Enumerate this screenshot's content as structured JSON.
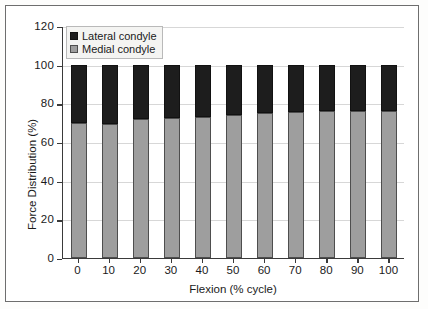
{
  "chart_data": {
    "type": "bar",
    "stacked": true,
    "title": "",
    "xlabel": "Flexion (% cycle)",
    "ylabel": "Force Distribution (%)",
    "categories": [
      "0",
      "10",
      "20",
      "30",
      "40",
      "50",
      "60",
      "70",
      "80",
      "90",
      "100"
    ],
    "series": [
      {
        "name": "Medial condyle",
        "color": "#9e9e9e",
        "values": [
          70,
          69.5,
          72,
          72.5,
          73,
          74,
          75,
          75.5,
          76,
          76,
          76
        ]
      },
      {
        "name": "Lateral condyle",
        "color": "#1d1d1d",
        "values": [
          30,
          30.5,
          28,
          27.5,
          27,
          26,
          25,
          24.5,
          24,
          24,
          24
        ]
      }
    ],
    "stack_totals": [
      100,
      100,
      100,
      100,
      100,
      100,
      100,
      100,
      100,
      100,
      100
    ],
    "ylim": [
      0,
      120
    ],
    "yticks": [
      "0",
      "20",
      "40",
      "60",
      "80",
      "100",
      "120"
    ],
    "ytick_values": [
      0,
      20,
      40,
      60,
      80,
      100,
      120
    ],
    "xtick_labels": [
      "0",
      "10",
      "20",
      "30",
      "40",
      "50",
      "60",
      "70",
      "80",
      "90",
      "100"
    ],
    "grid": "horizontal",
    "legend_position": "top-left-inside"
  },
  "legend": {
    "entries": [
      {
        "label": "Lateral condyle",
        "swatch": "black-square-icon"
      },
      {
        "label": "Medial condyle",
        "swatch": "gray-square-icon"
      }
    ]
  },
  "axes": {
    "y_title": "Force Distribution (%)",
    "x_title": "Flexion (% cycle)"
  }
}
